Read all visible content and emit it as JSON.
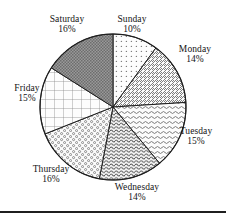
{
  "chart_data": {
    "type": "pie",
    "title": "",
    "subtitle": "",
    "xlabel": "",
    "ylabel": "",
    "legend_position": "none",
    "grid": false,
    "labels_show_percent": true,
    "start_angle_deg": 0,
    "direction": "clockwise",
    "categories": [
      "Sunday",
      "Monday",
      "Tuesday",
      "Wednesday",
      "Thursday",
      "Friday",
      "Saturday"
    ],
    "values": [
      10,
      14,
      15,
      14,
      16,
      15,
      16
    ],
    "total": 100,
    "slices": [
      {
        "name": "Sunday",
        "percent": 10,
        "percent_label": "10%",
        "pattern": "sparse-dots",
        "fill_color": "#fdfdfd",
        "pattern_color": "#7d7d7d"
      },
      {
        "name": "Monday",
        "percent": 14,
        "percent_label": "14%",
        "pattern": "diagonal-hatch",
        "fill_color": "#fbfbfb",
        "pattern_color": "#707070"
      },
      {
        "name": "Tuesday",
        "percent": 15,
        "percent_label": "15%",
        "pattern": "horizontal-wavy-lines",
        "fill_color": "#fcfcfc",
        "pattern_color": "#6e6e6e"
      },
      {
        "name": "Wednesday",
        "percent": 14,
        "percent_label": "14%",
        "pattern": "dense-wavy-lines",
        "fill_color": "#f7f7f7",
        "pattern_color": "#4e4e4e"
      },
      {
        "name": "Thursday",
        "percent": 16,
        "percent_label": "16%",
        "pattern": "medium-dots",
        "fill_color": "#fbfbfb",
        "pattern_color": "#6a6a6a"
      },
      {
        "name": "Friday",
        "percent": 15,
        "percent_label": "15%",
        "pattern": "cross-hatch-grid",
        "fill_color": "#fdfdfd",
        "pattern_color": "#8a8a8a"
      },
      {
        "name": "Saturday",
        "percent": 16,
        "percent_label": "16%",
        "pattern": "dense-checkerboard",
        "fill_color": "#9a9a9a",
        "pattern_color": "#5a5a5a"
      }
    ]
  },
  "figure": {
    "outline_color": "#1f1f1f",
    "background_color": "#ffffff",
    "center_x": 113,
    "center_y": 107,
    "radius": 73
  },
  "labels": {
    "sunday": {
      "name": "Sunday",
      "percent": "10%"
    },
    "monday": {
      "name": "Monday",
      "percent": "14%"
    },
    "tuesday": {
      "name": "Tuesday",
      "percent": "15%"
    },
    "wednesday": {
      "name": "Wednesday",
      "percent": "14%"
    },
    "thursday": {
      "name": "Thursday",
      "percent": "16%"
    },
    "friday": {
      "name": "Friday",
      "percent": "15%"
    },
    "saturday": {
      "name": "Saturday",
      "percent": "16%"
    }
  }
}
